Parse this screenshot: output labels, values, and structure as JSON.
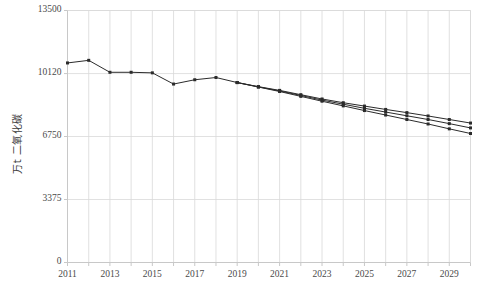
{
  "chart_data": {
    "type": "line",
    "title": "",
    "subtitle": "",
    "xlabel": "",
    "ylabel": "万t 二氧化碳",
    "xlim": [
      2011,
      2030
    ],
    "ylim": [
      0,
      13500
    ],
    "grid": true,
    "grid_axis": "both",
    "legend": null,
    "legend_position": "none",
    "yticks": [
      0,
      3375,
      6750,
      10120,
      13500
    ],
    "ytick_labels": [
      "0",
      "3375",
      "6750",
      "10120",
      "13500"
    ],
    "xticks": [
      2011,
      2013,
      2015,
      2017,
      2019,
      2021,
      2023,
      2025,
      2027,
      2029
    ],
    "xtick_labels": [
      "2011",
      "2013",
      "2015",
      "2017",
      "2019",
      "2021",
      "2023",
      "2025",
      "2027",
      "2029"
    ],
    "xticks_minor": [
      2012,
      2014,
      2016,
      2018,
      2020,
      2022,
      2024,
      2026,
      2028,
      2030
    ],
    "marker": "square",
    "marker_size": 3,
    "line_color": "#2b2b2b",
    "line_width": 1,
    "series": [
      {
        "name": "历史与情景一",
        "x": [
          2011,
          2012,
          2013,
          2014,
          2015,
          2016,
          2017,
          2018,
          2019,
          2020,
          2021,
          2022,
          2023,
          2024,
          2025,
          2026,
          2027,
          2028,
          2029,
          2030
        ],
        "values": [
          10690,
          10830,
          10190,
          10190,
          10160,
          9560,
          9790,
          9910,
          9640,
          9420,
          9220,
          8990,
          8760,
          8560,
          8380,
          8200,
          8030,
          7850,
          7660,
          7470
        ]
      },
      {
        "name": "情景二",
        "x": [
          2019,
          2020,
          2021,
          2022,
          2023,
          2024,
          2025,
          2026,
          2027,
          2028,
          2029,
          2030
        ],
        "values": [
          9640,
          9410,
          9190,
          8950,
          8700,
          8480,
          8260,
          8060,
          7860,
          7660,
          7440,
          7210
        ]
      },
      {
        "name": "情景三",
        "x": [
          2019,
          2020,
          2021,
          2022,
          2023,
          2024,
          2025,
          2026,
          2027,
          2028,
          2029,
          2030
        ],
        "values": [
          9640,
          9400,
          9160,
          8900,
          8640,
          8390,
          8140,
          7900,
          7660,
          7420,
          7160,
          6910
        ]
      }
    ]
  },
  "axis": {
    "y_title": "万t 二氧化碳"
  },
  "colors": {
    "line": "#2b2b2b",
    "grid": "#d9d9d9",
    "frame": "#c8c8c8",
    "text": "#4a4a4a"
  }
}
